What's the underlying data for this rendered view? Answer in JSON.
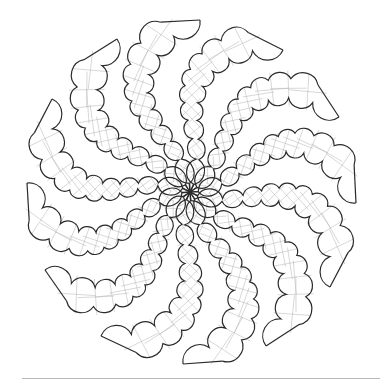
{
  "figure": {
    "arm_count": 12,
    "center": [
      190,
      192
    ],
    "tip_radius": 172,
    "stroke_color": "#2a2a2a",
    "hatch_color": "#b0b0b0",
    "background": "#ffffff",
    "tips": [
      [
        200,
        20
      ],
      [
        283,
        50
      ],
      [
        339,
        117
      ],
      [
        356,
        203
      ],
      [
        330,
        287
      ],
      [
        266,
        346
      ],
      [
        183,
        364
      ],
      [
        101,
        336
      ],
      [
        45,
        270
      ],
      [
        27,
        183
      ],
      [
        52,
        99
      ],
      [
        117,
        39
      ]
    ]
  },
  "footer_rule": {
    "color": "#b8b8b8"
  }
}
